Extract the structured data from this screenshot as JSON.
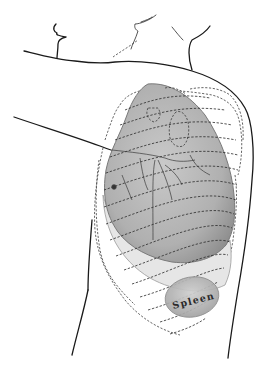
{
  "figure": {
    "labels": {
      "spleen": "Spleen"
    },
    "colors": {
      "background": "#ffffff",
      "outline": "#1a1a1a",
      "lung_fill": "#a9a9a9",
      "lower_lobe_fill": "#e4e4e4",
      "spleen_fill": "#b5b5b5"
    }
  }
}
